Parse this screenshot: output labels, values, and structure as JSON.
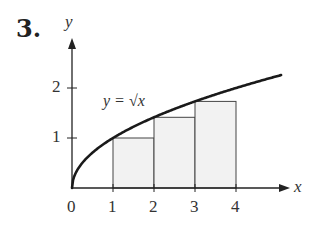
{
  "problem_number": "3.",
  "chart_data": {
    "type": "area",
    "title": "",
    "xlabel": "x",
    "ylabel": "y",
    "curve_label": "y = √x",
    "curve": {
      "function": "sqrt(x)",
      "x_range": [
        0,
        5.1
      ]
    },
    "rectangles": [
      {
        "x0": 1,
        "x1": 2,
        "height": 1
      },
      {
        "x0": 2,
        "x1": 3,
        "height": 1.414
      },
      {
        "x0": 3,
        "x1": 4,
        "height": 1.732
      }
    ],
    "x_ticks": [
      "0",
      "1",
      "2",
      "3",
      "4"
    ],
    "y_ticks": [
      "1",
      "2"
    ],
    "xlim": [
      0,
      5.2
    ],
    "ylim": [
      0,
      2.6
    ],
    "grid": false,
    "colors": {
      "curve": "#1a1a1a",
      "rect_fill": "#f2f2f2",
      "rect_stroke": "#444444",
      "axis": "#222222"
    }
  }
}
